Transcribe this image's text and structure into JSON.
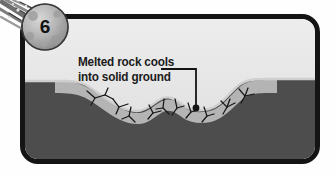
{
  "panel": {
    "step_number": "6",
    "badge_icon": "meteor-icon",
    "callout": {
      "line1": "Melted rock cools",
      "line2": "into solid ground",
      "pointer_icon": "leader-line-dot"
    },
    "scene": {
      "title": "Impact crater cross-section",
      "sky_label": "sky",
      "layers": [
        {
          "name": "surface-crust",
          "color": "#9d9d9d"
        },
        {
          "name": "upper-strata",
          "color": "#6f6f6f"
        },
        {
          "name": "light-strata",
          "color": "#b4b4b4"
        },
        {
          "name": "deep-bedrock",
          "color": "#4a4a4a"
        }
      ],
      "features": [
        {
          "name": "crater-depression"
        },
        {
          "name": "central-peak"
        },
        {
          "name": "fracture-cracks"
        }
      ]
    },
    "colors": {
      "frame": "#141414",
      "sky_top": "#ededed",
      "sky_bottom": "#dcdcdc",
      "text": "#1b1b1b",
      "crack": "#171717"
    }
  }
}
